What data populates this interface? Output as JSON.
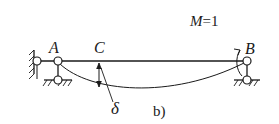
{
  "diagram": {
    "labels": {
      "A": "A",
      "B": "B",
      "C": "C",
      "delta": "δ",
      "moment": "M=1",
      "moment_symbol": "M",
      "moment_value": "=1",
      "caption": "b)"
    },
    "colors": {
      "stroke": "#1a1a1a",
      "background": "#ffffff"
    }
  }
}
